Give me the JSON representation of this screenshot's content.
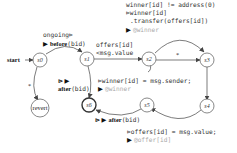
{
  "diagram": {
    "type": "state-machine",
    "start_label": "start",
    "states": [
      {
        "id": "s0",
        "label": "s0"
      },
      {
        "id": "s1",
        "label": "s1"
      },
      {
        "id": "s2",
        "label": "s2"
      },
      {
        "id": "s3",
        "label": "s3"
      },
      {
        "id": "s4",
        "label": "s4"
      },
      {
        "id": "s5",
        "label": "s5"
      },
      {
        "id": "s6",
        "label": "s6",
        "final": true
      },
      {
        "id": "revert",
        "label": "revert"
      }
    ],
    "edges": {
      "s0_s1": {
        "guard": "ongoing⊳",
        "marker": "▶",
        "keyword": "before",
        "arg": "(bid)"
      },
      "s1_s2": {
        "line1": "offers[id]",
        "line2": "<msg.value"
      },
      "s2_s3_curve": {
        "guard": "winner[id] != address(0)",
        "line2_prefix": "⊳",
        "line2": "winner[id]",
        "line3": ".transfer(offers[id])",
        "marker": "▶",
        "ref": "@winner"
      },
      "s2_s3_straight": {
        "label": "*"
      },
      "s0_revert": {
        "label": "*"
      },
      "s1_s6": {
        "prefix": "⊳ ▶",
        "keyword": "after",
        "arg": "(bid)"
      },
      "s2_s5": {
        "prefix": "⊳",
        "line1": "winner[id] = msg.sender;",
        "marker": "▶",
        "ref": "@winner"
      },
      "s5_s6": {
        "prefix": "⊳ ▶",
        "keyword": "after",
        "arg": "(bid)"
      },
      "s4_s5": {
        "prefix": "⊳",
        "line1": "offers[id] = msg.value;",
        "marker": "▶",
        "ref": "@offer[id]"
      }
    }
  }
}
